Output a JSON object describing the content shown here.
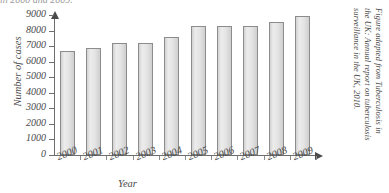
{
  "top_strip": {
    "text": "in 2000 and 2009."
  },
  "chart_data": {
    "type": "bar",
    "title": "",
    "xlabel": "Year",
    "ylabel": "Number of cases",
    "categories": [
      "2000",
      "2001",
      "2002",
      "2003",
      "2004",
      "2005",
      "2006",
      "2007",
      "2008",
      "2009"
    ],
    "values": [
      6700,
      6850,
      7200,
      7200,
      7600,
      8300,
      8320,
      8300,
      8580,
      8950
    ],
    "ylim": [
      0,
      9000
    ],
    "yticks": [
      0,
      1000,
      2000,
      3000,
      4000,
      5000,
      6000,
      7000,
      8000,
      9000
    ],
    "ytick_labels": [
      "0",
      "1000",
      "2000",
      "3000",
      "4000",
      "5000",
      "6000",
      "7000",
      "8000",
      "9000"
    ],
    "grid": false,
    "legend": null,
    "bar_fill_color": "#e2e2e2",
    "bar_edge_color": "#8c8c8c",
    "axis_color": "#6d6d6d"
  },
  "caption": {
    "line1": "Figure adapted from Tuberculosis in",
    "line2": "the UK: Annual report on tuberculosis",
    "line3": "surveillance in the UK, 2010."
  }
}
